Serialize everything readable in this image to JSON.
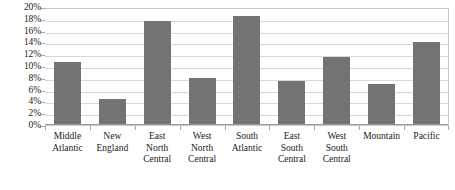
{
  "chart_data": {
    "type": "bar",
    "title": "",
    "xlabel": "",
    "ylabel": "",
    "ylim": [
      0,
      20
    ],
    "grid": true,
    "legend": false,
    "legend_position": "none",
    "tick_format": "percent",
    "bar_color": "#737373",
    "gridline_color": "#d8d8d8",
    "axis_color": "#9a9a9a",
    "plot_border_color": "#c9c9c9",
    "background_color": "#ffffff",
    "categories": [
      "Middle Atlantic",
      "New England",
      "East North Central",
      "West North Central",
      "South Atlantic",
      "East South Central",
      "West South Central",
      "Mountain",
      "Pacific"
    ],
    "category_label_lines": [
      [
        "Middle",
        "Atlantic"
      ],
      [
        "New",
        "England"
      ],
      [
        "East",
        "North",
        "Central"
      ],
      [
        "West",
        "North",
        "Central"
      ],
      [
        "South",
        "Atlantic"
      ],
      [
        "East",
        "South",
        "Central"
      ],
      [
        "West",
        "South",
        "Central"
      ],
      [
        "Mountain"
      ],
      [
        "Pacific"
      ]
    ],
    "values": [
      10.7,
      4.4,
      17.7,
      7.9,
      18.4,
      7.4,
      11.6,
      6.9,
      14.0
    ],
    "y_ticks": [
      0,
      2,
      4,
      6,
      8,
      10,
      12,
      14,
      16,
      18,
      20
    ],
    "y_tick_labels": [
      "0%",
      "2%",
      "4%",
      "6%",
      "8%",
      "10%",
      "12%",
      "14%",
      "16%",
      "18%",
      "20%"
    ]
  }
}
